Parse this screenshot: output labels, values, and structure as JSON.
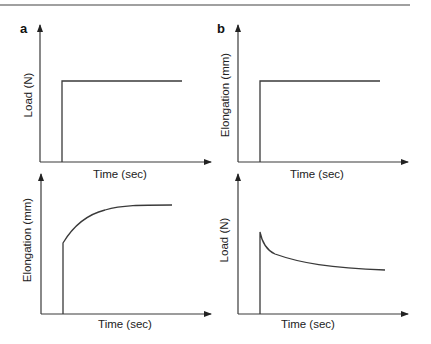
{
  "figure": {
    "panels": [
      {
        "id": "a",
        "label": "a"
      },
      {
        "id": "b",
        "label": "b"
      }
    ],
    "plots": {
      "a_top": {
        "ylabel": "Load (N)",
        "xlabel": "Time (sec)"
      },
      "a_bottom": {
        "ylabel": "Elongation (mm)",
        "xlabel": "Time (sec)"
      },
      "b_top": {
        "ylabel": "Elongation (mm)",
        "xlabel": "Time (sec)"
      },
      "b_bottom": {
        "ylabel": "Load (N)",
        "xlabel": "Time (sec)"
      }
    }
  },
  "colors": {
    "line": "#3a3a3a",
    "rule": "#808080"
  }
}
